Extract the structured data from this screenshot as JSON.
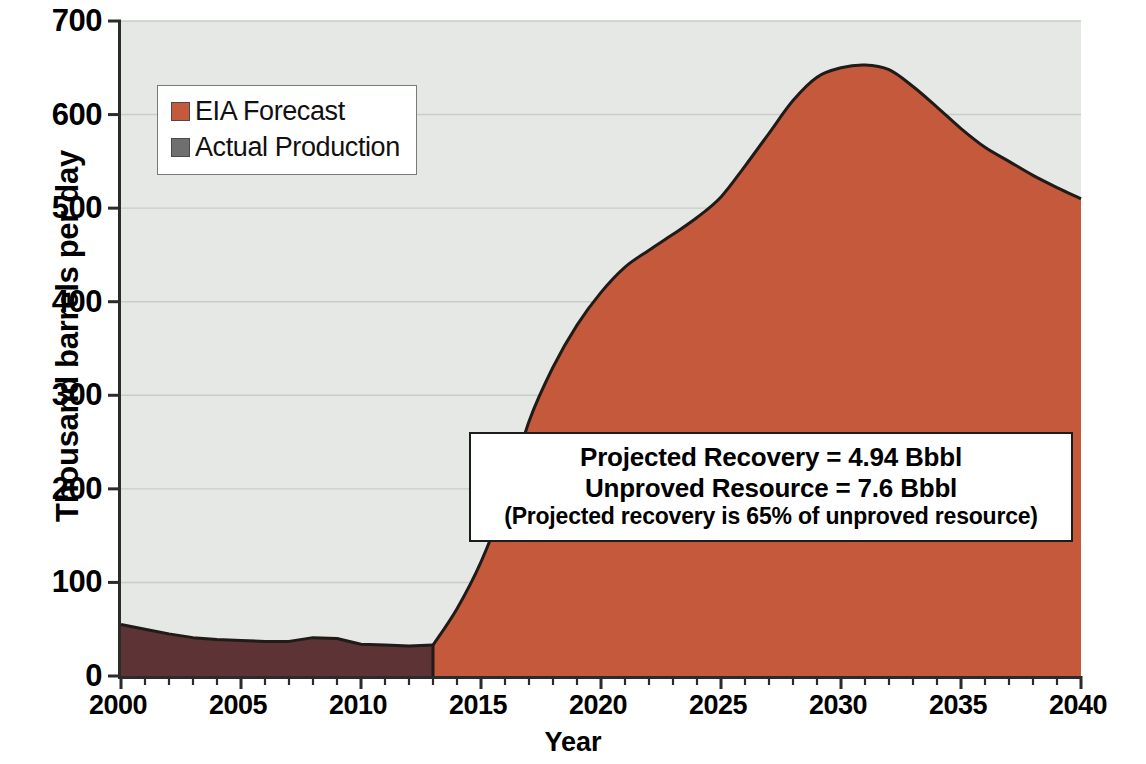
{
  "chart_data": {
    "type": "area",
    "title": "",
    "xlabel": "Year",
    "ylabel": "Thousand barrels per day",
    "xlim": [
      2000,
      2040
    ],
    "ylim": [
      0,
      700
    ],
    "ytick_step": 100,
    "xtick_step": 5,
    "xtick_minor_step": 1,
    "grid": true,
    "grid_axis": "y",
    "legend_position": "upper-left",
    "x": [
      2000,
      2001,
      2002,
      2003,
      2004,
      2005,
      2006,
      2007,
      2008,
      2009,
      2010,
      2011,
      2012,
      2013,
      2014,
      2015,
      2016,
      2017,
      2018,
      2019,
      2020,
      2021,
      2022,
      2023,
      2024,
      2025,
      2026,
      2027,
      2028,
      2029,
      2030,
      2031,
      2032,
      2033,
      2034,
      2035,
      2036,
      2037,
      2038,
      2039,
      2040
    ],
    "series": [
      {
        "name": "Actual Production",
        "color": "#5d3335",
        "x": [
          2000,
          2001,
          2002,
          2003,
          2004,
          2005,
          2006,
          2007,
          2008,
          2009,
          2010,
          2011,
          2012,
          2013
        ],
        "values": [
          55,
          50,
          45,
          41,
          39,
          38,
          37,
          37,
          41,
          40,
          34,
          33,
          32,
          33
        ]
      },
      {
        "name": "EIA Forecast",
        "color": "#c4593c",
        "x": [
          2013,
          2014,
          2015,
          2016,
          2017,
          2018,
          2019,
          2020,
          2021,
          2022,
          2023,
          2024,
          2025,
          2026,
          2027,
          2028,
          2029,
          2030,
          2031,
          2032,
          2033,
          2034,
          2035,
          2036,
          2037,
          2038,
          2039,
          2040
        ],
        "values": [
          33,
          72,
          122,
          188,
          272,
          330,
          375,
          410,
          437,
          455,
          472,
          490,
          512,
          545,
          580,
          615,
          640,
          650,
          653,
          648,
          630,
          608,
          585,
          565,
          550,
          535,
          522,
          510
        ]
      }
    ],
    "ytick_labels": [
      "0",
      "100",
      "200",
      "300",
      "400",
      "500",
      "600",
      "700"
    ],
    "xtick_labels": [
      "2000",
      "2005",
      "2010",
      "2015",
      "2020",
      "2025",
      "2030",
      "2035",
      "2040"
    ],
    "annotations": [
      {
        "name": "projection-summary",
        "lines": [
          "Projected Recovery = 4.94 Bbbl",
          "Unproved Resource = 7.6 Bbbl",
          "(Projected recovery is 65% of unproved resource)"
        ]
      }
    ],
    "legend_entries": [
      {
        "label": "EIA Forecast",
        "color": "#c4593c"
      },
      {
        "label": "Actual Production",
        "color": "#6f6f6f"
      }
    ]
  },
  "axes": {
    "y_title": "Thousand barrels per day",
    "x_title": "Year",
    "y_ticks": [
      "700",
      "600",
      "500",
      "400",
      "300",
      "200",
      "100",
      "0"
    ],
    "x_ticks": [
      "2000",
      "2005",
      "2010",
      "2015",
      "2020",
      "2025",
      "2030",
      "2035",
      "2040"
    ]
  },
  "legend": {
    "entries": [
      {
        "label": "EIA Forecast",
        "color": "#c4593c"
      },
      {
        "label": "Actual Production",
        "color": "#6f6f6f"
      }
    ]
  },
  "annotation": {
    "line1": "Projected Recovery = 4.94 Bbbl",
    "line2": "Unproved Resource = 7.6 Bbbl",
    "line3": "(Projected recovery is 65% of unproved resource)"
  },
  "colors": {
    "forecast_fill": "#c4593c",
    "actual_fill": "#5d3335",
    "plot_background": "#e5e8e4",
    "axis": "#2b2b2b",
    "gridline": "#c9ccc8",
    "curve_outline": "#201a18"
  }
}
